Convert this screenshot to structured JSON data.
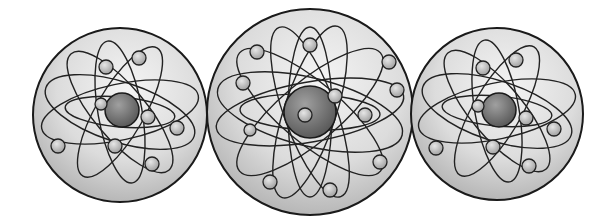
{
  "image": {
    "description": "Three grayscale illustrated atom spheres side by side, the middle one larger",
    "background": "#ffffff",
    "sphere_fill_light": "#eeeeee",
    "sphere_fill_dark": "#9a9a9a",
    "stroke": "#1a1a1a",
    "nucleus_dark": "#6a6a6a",
    "electron_fill": "#c8c8c8"
  },
  "atoms": [
    {
      "name": "left-atom",
      "cx": 120,
      "cy": 115,
      "r": 87
    },
    {
      "name": "center-atom",
      "cx": 310,
      "cy": 112,
      "r": 103
    },
    {
      "name": "right-atom",
      "cx": 497,
      "cy": 114,
      "r": 86
    }
  ]
}
